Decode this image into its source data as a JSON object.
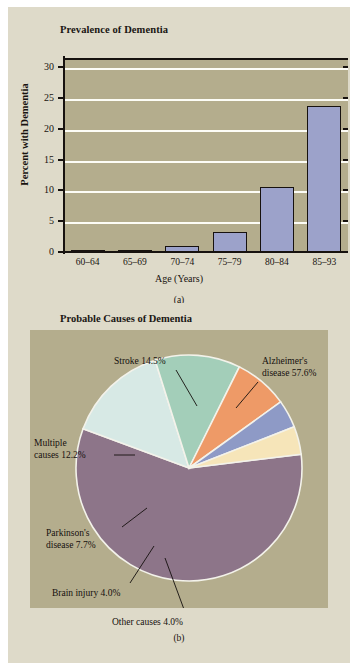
{
  "figure": {
    "background_color": "#ffffff",
    "panel_background": "#dedac9",
    "plot_background": "#b4ad8d"
  },
  "panel_a": {
    "title": "Prevalence of Dementia",
    "caption": "(a)"
  },
  "panel_b": {
    "title": "Probable Causes of Dementia",
    "caption": "(b)"
  },
  "footnote": {
    "text": ""
  },
  "chart_data": [
    {
      "type": "bar",
      "title": "Prevalence of Dementia",
      "xlabel": "Age (Years)",
      "ylabel": "Percent with Dementia",
      "categories": [
        "60–64",
        "65–69",
        "70–74",
        "75–79",
        "80–84",
        "85–93"
      ],
      "values": [
        0.1,
        0.3,
        1.0,
        3.3,
        10.5,
        23.7
      ],
      "ylim": [
        0,
        31.5
      ],
      "yticks": [
        0,
        5,
        10,
        15,
        20,
        25,
        30
      ],
      "ytick_labels": [
        "0",
        "5",
        "10",
        "15",
        "20",
        "25",
        "30"
      ],
      "grid": true,
      "grid_color": "#fdfdf6",
      "bar_color": "#9ca2ca",
      "bar_edge_color": "#17120f",
      "legend": "none"
    },
    {
      "type": "pie",
      "title": "Probable Causes of Dementia",
      "legend": "labels-with-leader-lines",
      "slices": [
        {
          "name": "Alzheimer's disease",
          "label": "Alzheimer's",
          "label_line2": "disease 57.6%",
          "value": 57.6,
          "color": "#8d7589"
        },
        {
          "name": "Stroke",
          "label": "Stroke 14.5%",
          "label_line2": "",
          "value": 14.5,
          "color": "#d7e9e5"
        },
        {
          "name": "Multiple causes",
          "label": "Multiple",
          "label_line2": "causes 12.2%",
          "value": 12.2,
          "color": "#a3ceb9"
        },
        {
          "name": "Parkinson's disease",
          "label": "Parkinson's",
          "label_line2": "disease 7.7%",
          "value": 7.7,
          "color": "#ee9a67"
        },
        {
          "name": "Brain injury",
          "label": "Brain injury 4.0%",
          "label_line2": "",
          "value": 4.0,
          "color": "#8e9ac6"
        },
        {
          "name": "Other causes",
          "label": "Other causes 4.0%",
          "label_line2": "",
          "value": 4.0,
          "color": "#f6e5b9"
        }
      ]
    }
  ]
}
